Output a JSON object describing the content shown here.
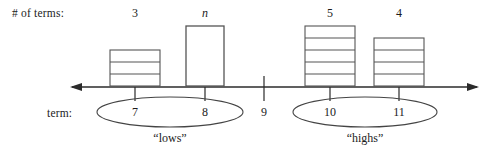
{
  "figure": {
    "row_labels": {
      "terms_count": "# of terms:",
      "term": "term:"
    },
    "columns": [
      {
        "term": "7",
        "count_label": "3",
        "segments": 3,
        "kind": "stack",
        "x_center": 135
      },
      {
        "term": "8",
        "count_label": "n",
        "segments": 0,
        "kind": "unknown",
        "x_center": 205,
        "glyph": "?"
      },
      {
        "term": "9",
        "count_label": "",
        "segments": 0,
        "kind": "none",
        "x_center": 264
      },
      {
        "term": "10",
        "count_label": "5",
        "segments": 5,
        "kind": "stack",
        "x_center": 330
      },
      {
        "term": "11",
        "count_label": "4",
        "segments": 4,
        "kind": "stack",
        "x_center": 399
      }
    ],
    "groups": [
      {
        "caption": "“lows”",
        "terms": [
          "7",
          "8"
        ],
        "x_center": 170,
        "rx": 73
      },
      {
        "caption": "“highs”",
        "terms": [
          "10",
          "11"
        ],
        "x_center": 365,
        "rx": 72
      }
    ],
    "axis": {
      "y": 87,
      "x_start": 70,
      "x_end": 479,
      "left_arrow": true,
      "right_arrow": true
    },
    "colors": {
      "ink": "#1a1a1a",
      "line": "#2b2b2b",
      "box_stroke": "#555555",
      "ellipse_stroke": "#444444",
      "background": "#ffffff"
    }
  }
}
